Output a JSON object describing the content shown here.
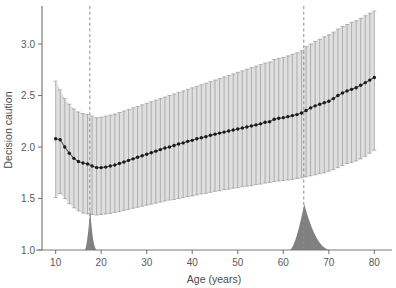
{
  "figure": {
    "title": "",
    "background_color": "#ffffff"
  },
  "axes": {
    "xlabel": "Age (years)",
    "ylabel": "Decision caution",
    "x_ticks": [
      "10",
      "20",
      "30",
      "40",
      "50",
      "60",
      "70",
      "80"
    ],
    "y_ticks": [
      "1.0",
      "1.5",
      "2.0",
      "2.5",
      "3.0"
    ]
  },
  "colors": {
    "point": "#1a1a1a",
    "line": "#555555",
    "errorbar": "#9a9a9a",
    "band": "#d9d9d9",
    "density": "#808080",
    "dashed_line": "#8c8c8c",
    "spine": "#7a7a7a",
    "text": "#4c4c4c"
  },
  "chart_data": {
    "type": "line",
    "title": "",
    "xlabel": "Age (years)",
    "ylabel": "Decision caution",
    "xlim": [
      7.0,
      83.0
    ],
    "ylim": [
      1.0,
      3.35
    ],
    "xticks": [
      10,
      20,
      30,
      40,
      50,
      60,
      70,
      80
    ],
    "yticks": [
      1.0,
      1.5,
      2.0,
      2.5,
      3.0
    ],
    "grid": false,
    "legend": null,
    "x": [
      10,
      11,
      12,
      13,
      14,
      15,
      16,
      17,
      18,
      19,
      20,
      21,
      22,
      23,
      24,
      25,
      26,
      27,
      28,
      29,
      30,
      31,
      32,
      33,
      34,
      35,
      36,
      37,
      38,
      39,
      40,
      41,
      42,
      43,
      44,
      45,
      46,
      47,
      48,
      49,
      50,
      51,
      52,
      53,
      54,
      55,
      56,
      57,
      58,
      59,
      60,
      61,
      62,
      63,
      64,
      65,
      66,
      67,
      68,
      69,
      70,
      71,
      72,
      73,
      74,
      75,
      76,
      77,
      78,
      79,
      80
    ],
    "y": [
      2.08,
      2.07,
      2.0,
      1.94,
      1.89,
      1.86,
      1.845,
      1.835,
      1.815,
      1.8,
      1.8,
      1.805,
      1.815,
      1.825,
      1.84,
      1.855,
      1.87,
      1.885,
      1.9,
      1.915,
      1.93,
      1.945,
      1.96,
      1.975,
      1.99,
      2.0,
      2.015,
      2.03,
      2.04,
      2.055,
      2.065,
      2.08,
      2.09,
      2.1,
      2.115,
      2.125,
      2.135,
      2.145,
      2.155,
      2.165,
      2.175,
      2.185,
      2.195,
      2.205,
      2.215,
      2.225,
      2.24,
      2.245,
      2.27,
      2.28,
      2.285,
      2.295,
      2.305,
      2.315,
      2.33,
      2.355,
      2.38,
      2.4,
      2.415,
      2.43,
      2.445,
      2.47,
      2.5,
      2.525,
      2.545,
      2.56,
      2.575,
      2.6,
      2.625,
      2.65,
      2.675
    ],
    "yerr_lower": [
      1.51,
      1.55,
      1.5,
      1.45,
      1.41,
      1.38,
      1.36,
      1.35,
      1.345,
      1.34,
      1.345,
      1.35,
      1.355,
      1.365,
      1.375,
      1.385,
      1.395,
      1.405,
      1.415,
      1.425,
      1.435,
      1.445,
      1.455,
      1.465,
      1.475,
      1.485,
      1.49,
      1.5,
      1.51,
      1.52,
      1.525,
      1.535,
      1.545,
      1.55,
      1.56,
      1.57,
      1.575,
      1.585,
      1.59,
      1.6,
      1.605,
      1.615,
      1.62,
      1.625,
      1.635,
      1.64,
      1.65,
      1.655,
      1.665,
      1.67,
      1.675,
      1.68,
      1.685,
      1.695,
      1.7,
      1.71,
      1.72,
      1.73,
      1.74,
      1.75,
      1.765,
      1.78,
      1.8,
      1.82,
      1.84,
      1.85,
      1.865,
      1.885,
      1.91,
      1.94,
      1.97
    ],
    "yerr_upper": [
      2.64,
      2.555,
      2.47,
      2.415,
      2.37,
      2.34,
      2.325,
      2.315,
      2.3,
      2.285,
      2.29,
      2.3,
      2.31,
      2.32,
      2.335,
      2.35,
      2.365,
      2.38,
      2.395,
      2.41,
      2.425,
      2.44,
      2.455,
      2.47,
      2.485,
      2.5,
      2.515,
      2.53,
      2.545,
      2.56,
      2.575,
      2.59,
      2.605,
      2.62,
      2.635,
      2.65,
      2.665,
      2.68,
      2.695,
      2.71,
      2.725,
      2.74,
      2.755,
      2.77,
      2.785,
      2.8,
      2.815,
      2.825,
      2.85,
      2.86,
      2.87,
      2.885,
      2.9,
      2.915,
      2.935,
      2.975,
      3.0,
      3.025,
      3.045,
      3.07,
      3.09,
      3.115,
      3.145,
      3.17,
      3.19,
      3.21,
      3.225,
      3.25,
      3.275,
      3.3,
      3.32
    ],
    "vertical_reference_lines": [
      17.5,
      64.5
    ],
    "density_peaks": [
      {
        "center": 17.6,
        "label": "young-adult-transition"
      },
      {
        "center": 64.6,
        "label": "older-adult-transition"
      }
    ],
    "annotations": []
  }
}
